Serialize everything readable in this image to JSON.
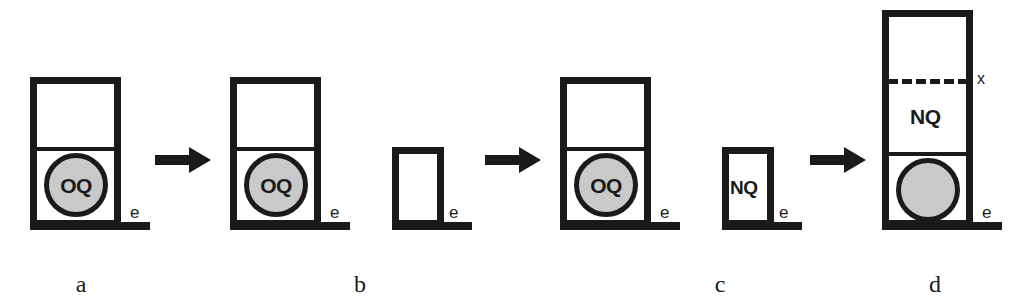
{
  "figure": {
    "kind": "process-sequence-diagram",
    "background_color": "#ffffff",
    "ink_color": "#1a1a1a",
    "ball_fill_color": "#c9c9c9",
    "panels": [
      {
        "caption": "a",
        "vessel_label_upper": "",
        "ball_label": "OQ",
        "ground_label": "e",
        "has_ball": true,
        "has_divider": true,
        "has_dashed_level": false
      },
      {
        "caption": "b",
        "vessel_label_upper": "",
        "ball_label": "OQ",
        "ground_label": "e",
        "second_vessel_label": "",
        "second_ground_label": "e",
        "has_ball": true,
        "has_divider": true,
        "has_dashed_level": false
      },
      {
        "caption": "c",
        "vessel_label_upper": "",
        "ball_label": "OQ",
        "ground_label": "e",
        "second_vessel_label": "NQ",
        "second_ground_label": "e",
        "has_ball": true,
        "has_divider": true,
        "has_dashed_level": false
      },
      {
        "caption": "d",
        "vessel_label_upper": "NQ",
        "ball_label": "",
        "ground_label": "e",
        "level_label": "x",
        "has_ball": true,
        "has_divider": true,
        "has_dashed_level": true
      }
    ],
    "arrows": [
      {
        "name": "arrow-a-to-b",
        "direction": "right"
      },
      {
        "name": "arrow-b-to-c",
        "direction": "right"
      },
      {
        "name": "arrow-c-to-d",
        "direction": "right"
      }
    ]
  }
}
